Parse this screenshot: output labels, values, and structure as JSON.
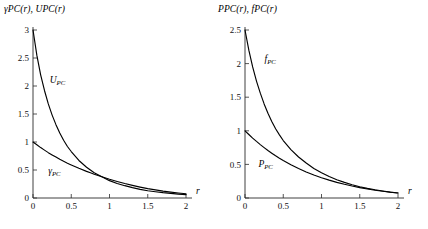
{
  "figure": {
    "background_color": "#ffffff",
    "curve_color": "#000000",
    "axis_color": "#2b2b2b"
  },
  "panels": [
    {
      "id": "left-panel",
      "ylabel": "γPC(r),  UPC(r)",
      "xlabel": "r"
    },
    {
      "id": "right-panel",
      "ylabel": "PPC(r),  fPC(r)",
      "xlabel": "r"
    }
  ],
  "chart_data": [
    {
      "type": "line",
      "title": "",
      "xlabel": "r",
      "ylabel": "γPC(r), UPC(r)",
      "xlim": [
        0,
        2
      ],
      "ylim": [
        0,
        3
      ],
      "xticks": [
        0,
        0.5,
        1,
        1.5,
        2
      ],
      "xtick_labels": [
        "0",
        "0.5",
        "1",
        "1.5",
        "2"
      ],
      "yticks": [
        0,
        0.5,
        1,
        1.5,
        2,
        2.5,
        3
      ],
      "ytick_labels": [
        "0",
        "0.5",
        "1",
        "1.5",
        "2",
        "2.5",
        "3"
      ],
      "grid": false,
      "legend": "inline-annotations",
      "annotations": [
        {
          "text": "UPC",
          "x": 0.32,
          "y": 2.05
        },
        {
          "text": "γPC",
          "x": 0.28,
          "y": 0.42
        }
      ],
      "series": [
        {
          "name": "UPC",
          "label": "UPC",
          "x": [
            0.0,
            0.05,
            0.1,
            0.15,
            0.2,
            0.25,
            0.3,
            0.35,
            0.4,
            0.45,
            0.5,
            0.6,
            0.7,
            0.75,
            0.8,
            0.9,
            1.0,
            1.1,
            1.2,
            1.3,
            1.4,
            1.5,
            1.6,
            1.7,
            1.8,
            1.9,
            2.0
          ],
          "values": [
            3.0,
            2.55,
            2.2,
            1.92,
            1.68,
            1.48,
            1.31,
            1.16,
            1.03,
            0.92,
            0.83,
            0.67,
            0.55,
            0.5,
            0.45,
            0.38,
            0.31,
            0.26,
            0.22,
            0.185,
            0.155,
            0.13,
            0.112,
            0.095,
            0.082,
            0.07,
            0.06
          ]
        },
        {
          "name": "gammaPC",
          "label": "γPC",
          "x": [
            0.0,
            0.05,
            0.1,
            0.15,
            0.2,
            0.25,
            0.3,
            0.35,
            0.4,
            0.45,
            0.5,
            0.6,
            0.7,
            0.75,
            0.8,
            0.9,
            1.0,
            1.1,
            1.2,
            1.3,
            1.4,
            1.5,
            1.6,
            1.7,
            1.8,
            1.9,
            2.0
          ],
          "values": [
            1.0,
            0.95,
            0.9,
            0.855,
            0.81,
            0.77,
            0.73,
            0.69,
            0.655,
            0.62,
            0.59,
            0.53,
            0.475,
            0.45,
            0.425,
            0.38,
            0.335,
            0.295,
            0.258,
            0.225,
            0.195,
            0.168,
            0.145,
            0.124,
            0.106,
            0.09,
            0.075
          ]
        }
      ]
    },
    {
      "type": "line",
      "title": "",
      "xlabel": "r",
      "ylabel": "PPC(r), fPC(r)",
      "xlim": [
        0,
        2
      ],
      "ylim": [
        0,
        2.5
      ],
      "xticks": [
        0,
        0.5,
        1,
        1.5,
        2
      ],
      "xtick_labels": [
        "0",
        "0.5",
        "1",
        "1.5",
        "2"
      ],
      "yticks": [
        0,
        0.5,
        1,
        1.5,
        2,
        2.5
      ],
      "ytick_labels": [
        "0",
        "0.5",
        "1",
        "1.5",
        "2",
        "2.5"
      ],
      "grid": false,
      "legend": "inline-annotations",
      "annotations": [
        {
          "text": "fPC",
          "x": 0.33,
          "y": 2.02
        },
        {
          "text": "PPC",
          "x": 0.27,
          "y": 0.46
        }
      ],
      "series": [
        {
          "name": "fPC",
          "label": "fPC",
          "x": [
            0.0,
            0.05,
            0.1,
            0.15,
            0.2,
            0.25,
            0.3,
            0.35,
            0.4,
            0.45,
            0.5,
            0.6,
            0.7,
            0.8,
            0.9,
            1.0,
            1.1,
            1.2,
            1.3,
            1.4,
            1.5,
            1.6,
            1.7,
            1.8,
            1.9,
            2.0
          ],
          "values": [
            2.5,
            2.2,
            1.95,
            1.74,
            1.56,
            1.4,
            1.26,
            1.14,
            1.03,
            0.94,
            0.855,
            0.72,
            0.61,
            0.52,
            0.44,
            0.375,
            0.32,
            0.272,
            0.232,
            0.198,
            0.168,
            0.143,
            0.122,
            0.104,
            0.088,
            0.075
          ]
        },
        {
          "name": "PPC",
          "label": "PPC",
          "x": [
            0.0,
            0.05,
            0.1,
            0.15,
            0.2,
            0.25,
            0.3,
            0.35,
            0.4,
            0.45,
            0.5,
            0.6,
            0.7,
            0.8,
            0.9,
            1.0,
            1.1,
            1.2,
            1.3,
            1.4,
            1.5,
            1.6,
            1.7,
            1.8,
            1.9,
            2.0
          ],
          "values": [
            1.0,
            0.945,
            0.892,
            0.842,
            0.795,
            0.75,
            0.707,
            0.667,
            0.628,
            0.592,
            0.558,
            0.495,
            0.438,
            0.388,
            0.343,
            0.302,
            0.266,
            0.233,
            0.204,
            0.178,
            0.155,
            0.134,
            0.116,
            0.1,
            0.086,
            0.074
          ]
        }
      ]
    }
  ]
}
